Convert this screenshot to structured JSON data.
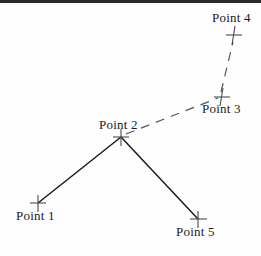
{
  "canvas": {
    "width": 261,
    "height": 256,
    "background": "#fefefe",
    "border_top_color": "#2b2b2b"
  },
  "diagram": {
    "title": "",
    "type": "node-link-diagram",
    "marker_style": "cross",
    "marker_color": "#4a4a4a",
    "solid_edge_color": "#1a1a1a",
    "dashed_edge_color": "#555555",
    "nodes": [
      {
        "id": "point-1",
        "label": "Point 1",
        "x": 38,
        "y": 203,
        "label_x": 16,
        "label_y": 208
      },
      {
        "id": "point-2",
        "label": "Point 2",
        "x": 121,
        "y": 137,
        "label_x": 99,
        "label_y": 117
      },
      {
        "id": "point-3",
        "label": "Point 3",
        "x": 222,
        "y": 97,
        "label_x": 202,
        "label_y": 101
      },
      {
        "id": "point-4",
        "label": "Point 4",
        "x": 234,
        "y": 35,
        "label_x": 212,
        "label_y": 10
      },
      {
        "id": "point-5",
        "label": "Point 5",
        "x": 198,
        "y": 219,
        "label_x": 176,
        "label_y": 224
      }
    ],
    "edges": [
      {
        "id": "edge-p1-p2",
        "from": "point-1",
        "to": "point-2",
        "style": "solid",
        "x1": 38,
        "y1": 203,
        "x2": 121,
        "y2": 137
      },
      {
        "id": "edge-p2-p5",
        "from": "point-2",
        "to": "point-5",
        "style": "solid",
        "x1": 121,
        "y1": 137,
        "x2": 198,
        "y2": 219
      },
      {
        "id": "edge-p2-p3",
        "from": "point-2",
        "to": "point-3",
        "style": "dashed",
        "x1": 126,
        "y1": 134,
        "x2": 218,
        "y2": 98
      },
      {
        "id": "edge-p3-p4",
        "from": "point-3",
        "to": "point-4",
        "style": "dashed",
        "x1": 221,
        "y1": 92,
        "x2": 233,
        "y2": 42
      }
    ]
  }
}
